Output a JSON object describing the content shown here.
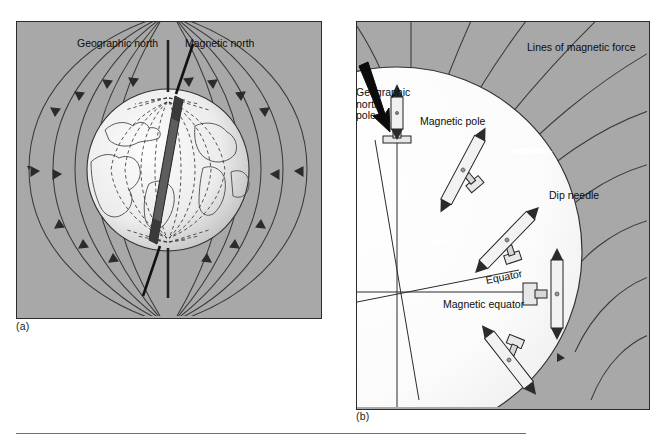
{
  "figure": {
    "background_color": "#ffffff",
    "panel_fill": "#a8a8a8",
    "globe_fill": "#f2f2f2",
    "line_color": "#2b2b2b",
    "rule_color": "#6f6f6f"
  },
  "panel_a": {
    "caption": "(a)",
    "labels": {
      "geographic_north": "Geographic north",
      "magnetic_north": "Magnetic north"
    },
    "description": "Earth globe with bar magnet tilted inside, dashed internal field lines and external magnetic field lines with arrowheads"
  },
  "panel_b": {
    "caption": "(b)",
    "labels": {
      "lines_of_force": "Lines of magnetic force",
      "geographic_north_pole": "Geographic\nnorth\npole",
      "magnetic_pole": "Magnetic pole",
      "dip_needle": "Dip needle",
      "equator": "Equator",
      "magnetic_equator": "Magnetic equator"
    },
    "description": "Enlarged globe quadrant showing dip needles at varying inclinations along magnetic field lines"
  }
}
